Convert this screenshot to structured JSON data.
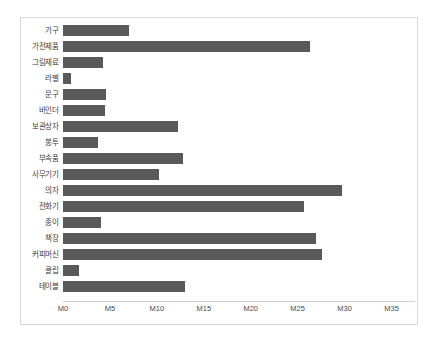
{
  "chart_data": {
    "type": "bar",
    "orientation": "horizontal",
    "title": "",
    "xlabel": "",
    "ylabel": "",
    "grid": false,
    "legend": null,
    "xlim": [
      0,
      37.5
    ],
    "xticks": [
      0,
      5,
      10,
      15,
      20,
      25,
      30,
      35
    ],
    "xtick_labels": [
      "M0",
      "M5",
      "M10",
      "M15",
      "M20",
      "M25",
      "M30",
      "M35"
    ],
    "bar_color": "#595959",
    "background_color": "#ffffff",
    "border_color": "#d8d8d8",
    "categories": [
      "가구",
      "가전제품",
      "그림재료",
      "라벨",
      "문구",
      "바인더",
      "보관상자",
      "봉투",
      "부속품",
      "사무기기",
      "의자",
      "전화기",
      "종이",
      "책장",
      "커피머신",
      "클립",
      "테이블"
    ],
    "values": [
      7.0,
      26.3,
      4.3,
      0.8,
      4.6,
      4.5,
      12.2,
      3.7,
      12.8,
      10.2,
      29.7,
      25.7,
      4.0,
      27.0,
      27.6,
      1.7,
      13.0
    ]
  }
}
